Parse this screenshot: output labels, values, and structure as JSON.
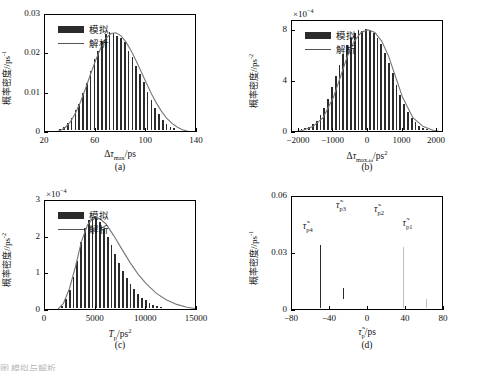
{
  "figure": {
    "bottom_caption": "图        模拟与解析…"
  },
  "legend": {
    "simulation": "模拟",
    "analytical": "解析"
  },
  "colors": {
    "bar_dark": "#2b2b2b",
    "bar_light": "#bfbfbf",
    "curve": "#777777",
    "axis": "#000000"
  },
  "chart_data": [
    {
      "id": "a",
      "type": "bar",
      "caption": "(a)",
      "title": "",
      "xlabel": "Δτ_max/ps",
      "xlabel_parts": {
        "delta": "Δ",
        "tau": "τ",
        "sub": "max",
        "unit": "/ps"
      },
      "ylabel": "概率密度/ps⁻¹",
      "ylabel_parts": {
        "cn": "概率密度",
        "unit": "/ps",
        "exp": "-1"
      },
      "xlim": [
        20,
        140
      ],
      "ylim": [
        0,
        0.03
      ],
      "xticks": [
        20,
        60,
        100,
        140
      ],
      "yticks": [
        0,
        0.01,
        0.02,
        0.03
      ],
      "ytick_labels": [
        "0",
        "0.01",
        "0.02",
        "0.03"
      ],
      "multiplier": "",
      "grid": false,
      "legend_position": "upper-left",
      "series": [
        {
          "name": "模拟",
          "kind": "histogram",
          "bin_width": 3,
          "x": [
            29,
            32,
            35,
            38,
            41,
            44,
            47,
            50,
            53,
            56,
            59,
            62,
            65,
            68,
            71,
            74,
            77,
            80,
            83,
            86,
            89,
            92,
            95,
            98,
            101,
            104,
            107,
            110,
            113,
            116,
            119,
            122,
            125,
            128,
            131
          ],
          "values": [
            0.0004,
            0.0008,
            0.0012,
            0.0022,
            0.0036,
            0.0055,
            0.0072,
            0.0098,
            0.0125,
            0.0155,
            0.0186,
            0.0205,
            0.023,
            0.0248,
            0.0254,
            0.0252,
            0.0243,
            0.0238,
            0.0228,
            0.0206,
            0.019,
            0.0168,
            0.0148,
            0.0126,
            0.0103,
            0.0082,
            0.0062,
            0.0045,
            0.003,
            0.0021,
            0.0014,
            0.0009,
            0.0006,
            0.0004,
            0.0002
          ]
        },
        {
          "name": "解析",
          "kind": "line",
          "x": [
            24,
            28,
            32,
            36,
            40,
            44,
            48,
            52,
            56,
            60,
            64,
            68,
            72,
            76,
            80,
            84,
            88,
            92,
            96,
            100,
            104,
            108,
            112,
            116,
            120,
            124,
            128,
            132,
            136
          ],
          "values": [
            5e-05,
            0.0002,
            0.0006,
            0.0014,
            0.0028,
            0.005,
            0.0079,
            0.0113,
            0.015,
            0.0185,
            0.0216,
            0.024,
            0.0253,
            0.0255,
            0.0247,
            0.0231,
            0.0209,
            0.0183,
            0.0155,
            0.0127,
            0.01,
            0.0076,
            0.0055,
            0.0038,
            0.0025,
            0.0016,
            0.0009,
            0.0005,
            0.0002
          ]
        }
      ]
    },
    {
      "id": "b",
      "type": "bar",
      "caption": "(b)",
      "title": "",
      "xlabel": "Δτ_max,ω/ps²",
      "xlabel_parts": {
        "delta": "Δ",
        "tau": "τ",
        "sub": "max,ω",
        "unit": "/ps",
        "unit_exp": "2"
      },
      "ylabel": "概率密度/ps⁻²",
      "ylabel_parts": {
        "cn": "概率密度",
        "unit": "/ps",
        "exp": "-2"
      },
      "xlim": [
        -2200,
        2200
      ],
      "ylim": [
        0,
        0.00088
      ],
      "xticks": [
        -2000,
        -1000,
        0,
        1000,
        2000
      ],
      "yticks": [
        0,
        0.0004,
        0.0008
      ],
      "ytick_labels": [
        "0",
        "4",
        "8"
      ],
      "multiplier": "×10⁻⁴",
      "grid": false,
      "legend_position": "upper-left",
      "series": [
        {
          "name": "模拟",
          "kind": "histogram",
          "bin_width": 110,
          "x": [
            -2035,
            -1925,
            -1815,
            -1705,
            -1595,
            -1485,
            -1375,
            -1265,
            -1155,
            -1045,
            -935,
            -825,
            -715,
            -605,
            -495,
            -385,
            -275,
            -165,
            -55,
            55,
            165,
            275,
            385,
            495,
            605,
            715,
            825,
            935,
            1045,
            1155,
            1265,
            1375,
            1485,
            1595,
            1705,
            1815,
            1925,
            2035
          ],
          "values": [
            1e-05,
            2e-05,
            3e-05,
            4e-05,
            6e-05,
            9e-05,
            0.00013,
            0.00019,
            0.00026,
            0.00035,
            0.00044,
            0.00053,
            0.00061,
            0.00068,
            0.00074,
            0.00078,
            0.0008,
            0.00079,
            0.00081,
            0.0008,
            0.00078,
            0.00074,
            0.00069,
            0.00062,
            0.00054,
            0.00046,
            0.00037,
            0.00029,
            0.00022,
            0.00016,
            0.00011,
            8e-05,
            5e-05,
            3e-05,
            2e-05,
            1e-05,
            1e-05,
            5e-06
          ]
        },
        {
          "name": "解析",
          "kind": "line",
          "x": [
            -2200,
            -1900,
            -1600,
            -1300,
            -1000,
            -800,
            -600,
            -400,
            -200,
            0,
            200,
            400,
            600,
            800,
            1000,
            1300,
            1600,
            1900,
            2200
          ],
          "values": [
            5e-06,
            2e-05,
            5e-05,
            0.00012,
            0.00028,
            0.00044,
            0.0006,
            0.00072,
            0.00079,
            0.00081,
            0.00079,
            0.00072,
            0.0006,
            0.00044,
            0.00028,
            0.00012,
            5e-05,
            2e-05,
            5e-06
          ]
        }
      ]
    },
    {
      "id": "c",
      "type": "bar",
      "caption": "(c)",
      "title": "",
      "xlabel": "T_p/ps²",
      "xlabel_parts": {
        "main": "T",
        "sub": "p",
        "unit": "/ps",
        "unit_exp": "2"
      },
      "ylabel": "概率密度/ps⁻²",
      "ylabel_parts": {
        "cn": "概率密度",
        "unit": "/ps",
        "exp": "-2"
      },
      "xlim": [
        0,
        15000
      ],
      "ylim": [
        0,
        0.0003
      ],
      "xticks": [
        0,
        5000,
        10000,
        15000
      ],
      "yticks": [
        0,
        0.0001,
        0.0002,
        0.0003
      ],
      "ytick_labels": [
        "0",
        "1",
        "2",
        "3"
      ],
      "multiplier": "×10⁻⁴",
      "grid": false,
      "legend_position": "upper-left",
      "series": [
        {
          "name": "模拟",
          "kind": "histogram",
          "bin_width": 375,
          "x": [
            1690,
            2065,
            2440,
            2815,
            3190,
            3565,
            3940,
            4315,
            4690,
            5065,
            5440,
            5815,
            6190,
            6565,
            6940,
            7315,
            7690,
            8065,
            8440,
            8815,
            9190,
            9565,
            9940,
            10315,
            10690,
            11065,
            11440,
            11815,
            12190,
            12565,
            12940,
            13315,
            13690,
            14065
          ],
          "values": [
            1.2e-05,
            3e-05,
            5.5e-05,
            9e-05,
            0.000135,
            0.000185,
            0.000225,
            0.000245,
            0.000255,
            0.000252,
            0.00024,
            0.000222,
            0.0002,
            0.000176,
            0.000152,
            0.000128,
            0.000106,
            8.6e-05,
            7e-05,
            5.6e-05,
            4.4e-05,
            3.4e-05,
            2.6e-05,
            2e-05,
            1.5e-05,
            1.1e-05,
            8e-06,
            6e-06,
            4e-06,
            3e-06,
            2e-06,
            1.5e-06,
            1e-06,
            8e-07
          ]
        },
        {
          "name": "解析",
          "kind": "line",
          "x": [
            1200,
            1800,
            2400,
            3000,
            3600,
            4200,
            4800,
            5400,
            6000,
            6800,
            7600,
            8400,
            9200,
            10000,
            11000,
            12000,
            13000,
            14000,
            15000
          ],
          "values": [
            3e-06,
            2e-05,
            6e-05,
            0.00012,
            0.00019,
            0.000235,
            0.000255,
            0.000252,
            0.000238,
            0.000205,
            0.000168,
            0.000132,
            0.0001,
            7.4e-05,
            4.8e-05,
            3e-05,
            1.8e-05,
            1e-05,
            6e-06
          ]
        }
      ]
    },
    {
      "id": "d",
      "type": "bar",
      "caption": "(d)",
      "title": "",
      "xlabel": "τ̃_p/ps",
      "xlabel_parts": {
        "tau": "τ",
        "sub": "p",
        "unit": "/ps"
      },
      "ylabel": "概率密度/ps⁻¹",
      "ylabel_parts": {
        "cn": "概率密度",
        "unit": "/ps",
        "exp": "-1"
      },
      "xlim": [
        -80,
        80
      ],
      "ylim": [
        0,
        0.06
      ],
      "xticks": [
        -80,
        -40,
        0,
        40,
        80
      ],
      "yticks": [
        0,
        0.03,
        0.06
      ],
      "ytick_labels": [
        "0",
        "0.03",
        "0.06"
      ],
      "multiplier": "",
      "grid": false,
      "legend_position": "none",
      "group_labels": [
        {
          "text": "τ̃p4",
          "tau": "τ",
          "sub": "p4",
          "x": -57,
          "y": 0.0435
        },
        {
          "text": "τ̃p3",
          "tau": "τ",
          "sub": "p3",
          "x": -22,
          "y": 0.0545
        },
        {
          "text": "τ̃p2",
          "tau": "τ",
          "sub": "p2",
          "x": 18,
          "y": 0.0525
        },
        {
          "text": "τ̃p1",
          "tau": "τ",
          "sub": "p1",
          "x": 48,
          "y": 0.0455
        }
      ],
      "series": [
        {
          "name": "τ̃p4",
          "kind": "histogram",
          "shade": "dark",
          "bin_width": 2.2,
          "x": [
            -72,
            -69.8,
            -67.6,
            -65.4,
            -63.2,
            -61,
            -58.8,
            -56.6,
            -54.4,
            -52.2,
            -50,
            -47.8,
            -45.6,
            -43.4,
            -41.2,
            -39,
            -36.8,
            -34.6,
            -32.4,
            -30.2,
            -28,
            -25.8,
            -23.6,
            -21.4
          ],
          "values": [
            0.0012,
            0.002,
            0.0032,
            0.0048,
            0.007,
            0.01,
            0.014,
            0.0185,
            0.0235,
            0.029,
            0.034,
            0.0385,
            0.042,
            0.044,
            0.0448,
            0.0438,
            0.041,
            0.0365,
            0.0305,
            0.024,
            0.0175,
            0.0115,
            0.0065,
            0.0028
          ]
        },
        {
          "name": "τ̃p3",
          "kind": "histogram",
          "shade": "light",
          "bin_width": 2.0,
          "x": [
            -30,
            -28,
            -26,
            -24,
            -22,
            -20,
            -18,
            -16,
            -14,
            -12,
            -10,
            -8,
            -6,
            -4,
            -2,
            0,
            2,
            4
          ],
          "values": [
            0.0015,
            0.003,
            0.0055,
            0.0095,
            0.015,
            0.0225,
            0.031,
            0.04,
            0.048,
            0.054,
            0.0575,
            0.056,
            0.05,
            0.041,
            0.0305,
            0.02,
            0.011,
            0.0045
          ]
        },
        {
          "name": "τ̃p2",
          "kind": "histogram",
          "shade": "dark",
          "bin_width": 2.0,
          "x": [
            -6,
            -4,
            -2,
            0,
            2,
            4,
            6,
            8,
            10,
            12,
            14,
            16,
            18,
            20,
            22,
            24,
            26,
            28
          ],
          "values": [
            0.002,
            0.004,
            0.0075,
            0.0125,
            0.0195,
            0.028,
            0.037,
            0.0455,
            0.052,
            0.056,
            0.0555,
            0.051,
            0.044,
            0.035,
            0.0255,
            0.0165,
            0.009,
            0.0038
          ]
        },
        {
          "name": "τ̃p1",
          "kind": "histogram",
          "shade": "light",
          "bin_width": 2.2,
          "x": [
            22,
            24.2,
            26.4,
            28.6,
            30.8,
            33,
            35.2,
            37.4,
            39.6,
            41.8,
            44,
            46.2,
            48.4,
            50.6,
            52.8,
            55,
            57.2,
            59.4,
            61.6,
            63.8,
            66,
            68.2
          ],
          "values": [
            0.0015,
            0.0028,
            0.0048,
            0.008,
            0.0125,
            0.0185,
            0.0255,
            0.033,
            0.0395,
            0.044,
            0.0445,
            0.043,
            0.039,
            0.0335,
            0.027,
            0.0205,
            0.0145,
            0.0095,
            0.0058,
            0.0032,
            0.0016,
            0.0007
          ]
        }
      ]
    }
  ]
}
